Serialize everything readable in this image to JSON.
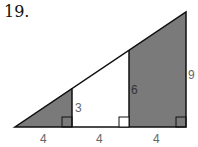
{
  "problem": {
    "number": "19."
  },
  "diagram": {
    "base_segments": [
      "4",
      "4",
      "4"
    ],
    "heights": [
      "3",
      "6",
      "9"
    ],
    "shade_color": "#7a7a7a",
    "line_color": "#111111"
  }
}
